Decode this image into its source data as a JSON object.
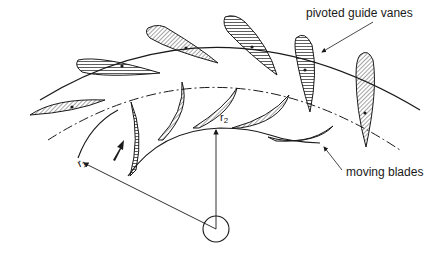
{
  "diagram": {
    "type": "radial turbine cascade schematic",
    "labels": {
      "guide_vanes": "pivoted guide vanes",
      "moving_blades": "moving blades",
      "r1_symbol": "r",
      "r1_sub": "1",
      "r2_symbol": "r",
      "r2_sub": "2"
    },
    "components": [
      {
        "name": "outer casing arc",
        "style": "solid line"
      },
      {
        "name": "pivot circle",
        "style": "dash-dot line"
      },
      {
        "name": "inner arc (r1)",
        "style": "solid line"
      },
      {
        "name": "pivoted guide vanes",
        "count": 5,
        "fill": "hatched"
      },
      {
        "name": "moving blades",
        "count": 5,
        "fill": "hatched"
      },
      {
        "name": "hub/axis circle",
        "style": "solid circle"
      },
      {
        "name": "flow direction arrow",
        "style": "filled arrow"
      }
    ],
    "colors": {
      "line": "#1a1a1a",
      "background": "#ffffff"
    }
  }
}
